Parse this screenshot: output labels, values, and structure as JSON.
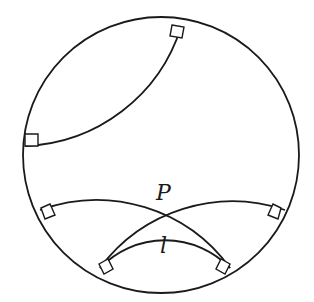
{
  "figure": {
    "type": "Poincare disk model of hyperbolic geometry",
    "disk": {
      "cx": 161,
      "cy": 155,
      "r": 138
    },
    "geodesics": [
      {
        "name": "upper-left-geodesic",
        "path": "M 181 27 A 170 170 0 0 1 25 146"
      },
      {
        "name": "geodesic-through-p-1",
        "path": "M 40 210 A 165 165 0 0 1 230 268"
      },
      {
        "name": "geodesic-through-p-2",
        "path": "M 100 268 A 165 165 0 0 1 285 210"
      },
      {
        "name": "line-l",
        "path": "M 100 268 A 90 90 0 0 1 230 268"
      }
    ],
    "right_angle_marks": [
      {
        "name": "right-angle-mark-top",
        "points": "172,25 184,27 182,38 170,36"
      },
      {
        "name": "right-angle-mark-left",
        "points": "25,134 38,134 38,146 25,146"
      },
      {
        "name": "right-angle-mark-mid-left",
        "points": "41,208 50,204 55,215 45,219"
      },
      {
        "name": "right-angle-mark-mid-right",
        "points": "281,208 273,204 268,215 278,219"
      },
      {
        "name": "right-angle-mark-bottom-left",
        "points": "99,264 108,259 113,269 104,274"
      },
      {
        "name": "right-angle-mark-bottom-right",
        "points": "230,264 221,259 216,269 225,274"
      }
    ],
    "labels": {
      "point_p": {
        "text": "P",
        "x": 156,
        "y": 200
      },
      "line_l": {
        "text": "l",
        "x": 160,
        "y": 253
      }
    }
  }
}
